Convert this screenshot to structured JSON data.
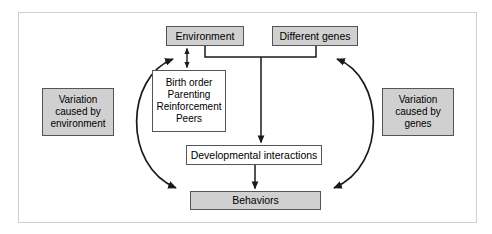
{
  "diagram": {
    "frame": {
      "name": "outer-frame",
      "border_color": "#cccccc",
      "background": "#ffffff"
    },
    "colors": {
      "box_fill_gray": "#d0d0d0",
      "box_fill_white": "#ffffff",
      "box_border": "#555555",
      "arrow": "#1a1a1a",
      "text": "#000000"
    },
    "nodes": [
      {
        "id": "environment",
        "label": "Environment",
        "fill": "gray"
      },
      {
        "id": "different_genes",
        "label": "Different genes",
        "fill": "gray"
      },
      {
        "id": "influences",
        "fill": "white",
        "lines": [
          "Birth order",
          "Parenting",
          "Reinforcement",
          "Peers"
        ]
      },
      {
        "id": "developmental_interactions",
        "label": "Developmental interactions",
        "fill": "white"
      },
      {
        "id": "behaviors",
        "label": "Behaviors",
        "fill": "gray"
      },
      {
        "id": "variation_environment",
        "fill": "gray",
        "lines": [
          "Variation",
          "caused by",
          "environment"
        ]
      },
      {
        "id": "variation_genes",
        "fill": "gray",
        "lines": [
          "Variation",
          "caused by",
          "genes"
        ]
      }
    ],
    "connectors": [
      {
        "id": "environment-to-influences",
        "kind": "double-arrow-vertical",
        "from": "environment",
        "to": "influences"
      },
      {
        "id": "environment-genes-to-developmental",
        "kind": "merge-down-arrow",
        "from": [
          "environment",
          "different_genes"
        ],
        "to": "developmental_interactions"
      },
      {
        "id": "developmental-to-behaviors",
        "kind": "arrow-down",
        "from": "developmental_interactions",
        "to": "behaviors"
      },
      {
        "id": "left-feedback-arc",
        "kind": "double-arrow-arc",
        "from": "environment",
        "to": "behaviors"
      },
      {
        "id": "right-feedback-arc",
        "kind": "double-arrow-arc",
        "from": "different_genes",
        "to": "behaviors"
      }
    ]
  }
}
